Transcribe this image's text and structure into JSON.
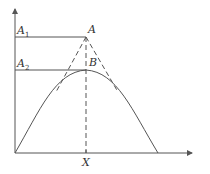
{
  "diagram": {
    "labels": {
      "a1": "A",
      "a1_sub": "1",
      "a2": "A",
      "a2_sub": "2",
      "point_a": "A",
      "point_b": "B",
      "x_axis_point": "X"
    },
    "colors": {
      "stroke": "#555555",
      "background": "#ffffff"
    },
    "elements": [
      "y-axis with arrow",
      "x-axis with arrow",
      "horizontal line A1 to point A",
      "horizontal line A2 to point B",
      "bell-shaped curve peaking at B",
      "dashed vertical line from A to X",
      "dashed tangent lines from A to curve"
    ]
  }
}
